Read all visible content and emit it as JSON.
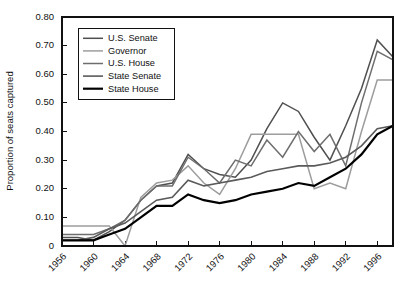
{
  "chart_data": {
    "type": "line",
    "title": "",
    "xlabel": "",
    "ylabel": "Proportion of seats captured",
    "xlim": [
      1956,
      1998
    ],
    "ylim": [
      0,
      0.8
    ],
    "grid": false,
    "legend_position": "top-left",
    "x": [
      1956,
      1958,
      1960,
      1962,
      1964,
      1966,
      1968,
      1970,
      1972,
      1974,
      1976,
      1978,
      1980,
      1982,
      1984,
      1986,
      1988,
      1990,
      1992,
      1994,
      1996,
      1998
    ],
    "xticks": [
      "1956",
      "1960",
      "1964",
      "1968",
      "1972",
      "1976",
      "1980",
      "1984",
      "1988",
      "1992",
      "1996"
    ],
    "yticks": [
      "0",
      "0.10",
      "0.20",
      "0.30",
      "0.40",
      "0.50",
      "0.60",
      "0.70",
      "0.80"
    ],
    "series": [
      {
        "name": "U.S. Senate",
        "color": "#4f4f4f",
        "width": 1.5,
        "values": [
          0.03,
          0.03,
          0.02,
          0.05,
          0.09,
          0.16,
          0.21,
          0.22,
          0.32,
          0.27,
          0.25,
          0.24,
          0.3,
          0.41,
          0.5,
          0.47,
          0.38,
          0.3,
          0.42,
          0.55,
          0.72,
          0.66
        ]
      },
      {
        "name": "Governor",
        "color": "#9d9d9d",
        "width": 1.5,
        "values": [
          0.07,
          0.07,
          0.07,
          0.07,
          0.0,
          0.17,
          0.22,
          0.23,
          0.28,
          0.22,
          0.18,
          0.27,
          0.39,
          0.39,
          0.39,
          0.39,
          0.2,
          0.22,
          0.2,
          0.4,
          0.58,
          0.58
        ]
      },
      {
        "name": "U.S. House",
        "color": "#6e6e6e",
        "width": 1.5,
        "values": [
          0.04,
          0.04,
          0.04,
          0.06,
          0.09,
          0.16,
          0.21,
          0.21,
          0.31,
          0.27,
          0.22,
          0.3,
          0.28,
          0.37,
          0.31,
          0.4,
          0.33,
          0.39,
          0.28,
          0.5,
          0.68,
          0.65
        ]
      },
      {
        "name": "State Senate",
        "color": "#5a5a5a",
        "width": 1.6,
        "values": [
          0.02,
          0.02,
          0.03,
          0.06,
          0.08,
          0.12,
          0.16,
          0.17,
          0.23,
          0.21,
          0.22,
          0.23,
          0.24,
          0.26,
          0.27,
          0.28,
          0.28,
          0.29,
          0.31,
          0.35,
          0.41,
          0.42
        ]
      },
      {
        "name": "State House",
        "color": "#000000",
        "width": 2.2,
        "values": [
          0.02,
          0.02,
          0.02,
          0.04,
          0.06,
          0.1,
          0.14,
          0.14,
          0.18,
          0.16,
          0.15,
          0.16,
          0.18,
          0.19,
          0.2,
          0.22,
          0.21,
          0.24,
          0.27,
          0.32,
          0.39,
          0.42
        ]
      }
    ]
  },
  "legend": {
    "entries": [
      {
        "label": "U.S. Senate"
      },
      {
        "label": "Governor"
      },
      {
        "label": "U.S. House"
      },
      {
        "label": "State Senate"
      },
      {
        "label": "State House"
      }
    ]
  }
}
